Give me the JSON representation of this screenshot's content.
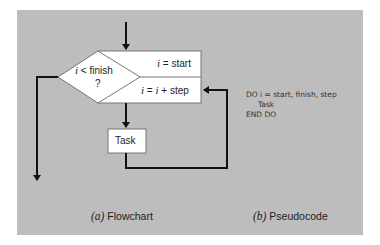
{
  "diagram": {
    "colors": {
      "background": "#ffffff",
      "panel": "#bdbdbd",
      "shape_fill": "#ffffff",
      "shape_stroke": "#777777",
      "arrow": "#111111"
    },
    "flowchart": {
      "decision": {
        "var": "i",
        "op": " < finish",
        "q": "?"
      },
      "init_box": {
        "var": "i",
        "text": " = start"
      },
      "increment_box": {
        "var1": "i",
        "mid": " = ",
        "var2": "i",
        "text": " + step"
      },
      "task_box": {
        "label": "Task"
      }
    },
    "pseudocode": {
      "line1": "DO i = start, finish, step",
      "line2": "Task",
      "line3": "END DO"
    },
    "captions": {
      "a_tag": "(a)",
      "a_label": " Flowchart",
      "b_tag": "(b)",
      "b_label": " Pseudocode"
    }
  }
}
